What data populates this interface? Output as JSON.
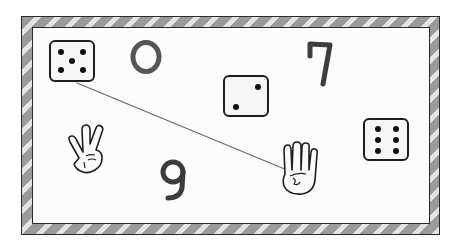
{
  "game": {
    "type": "matching-worksheet",
    "board": {
      "border_style": "diagonal-stripes",
      "border_colors": [
        "#9a9a9a",
        "#e4e4e4"
      ],
      "panel_color": "#fcfcfc",
      "outline_color": "#2a2a2a"
    },
    "items": [
      {
        "kind": "die",
        "value": 5,
        "x": 49,
        "y": 40,
        "w": 46,
        "h": 42
      },
      {
        "kind": "digit",
        "label": "0",
        "x": 128,
        "y": 34
      },
      {
        "kind": "die",
        "value": 2,
        "x": 223,
        "y": 75,
        "w": 46,
        "h": 42
      },
      {
        "kind": "digit",
        "label": "7",
        "x": 305,
        "y": 40
      },
      {
        "kind": "hand",
        "fingers": 2,
        "label": "two-fingers",
        "x": 65,
        "y": 125
      },
      {
        "kind": "digit",
        "label": "9",
        "x": 157,
        "y": 158
      },
      {
        "kind": "hand",
        "fingers": 4,
        "label": "four-fingers",
        "x": 282,
        "y": 142
      },
      {
        "kind": "die",
        "value": 6,
        "x": 363,
        "y": 118,
        "w": 46,
        "h": 43
      }
    ],
    "connections": [
      {
        "from": "die-5",
        "to": "hand-4",
        "x1": 77,
        "y1": 83,
        "x2": 287,
        "y2": 170,
        "color": "#6a6a6a"
      }
    ],
    "digit_color": "#3c3c3c"
  }
}
